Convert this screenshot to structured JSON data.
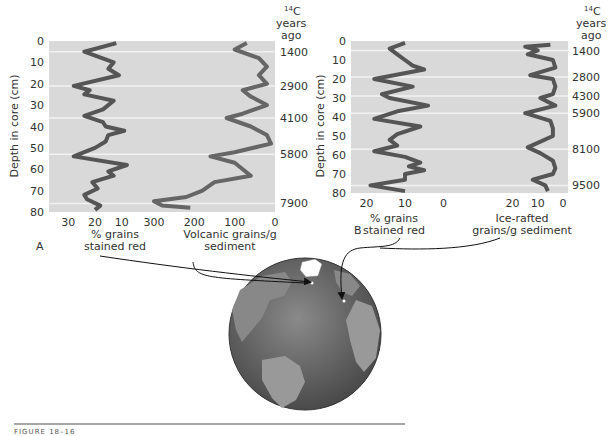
{
  "figure": {
    "caption": "FIGURE 18–16",
    "globe_alt": "North Atlantic globe with core locations"
  },
  "chart_data": [
    {
      "panel": "A",
      "type": "line",
      "orientation": "vertical-profile",
      "ylabel": "Depth in core (cm)",
      "ylim": [
        0,
        80
      ],
      "yticks": [
        0,
        10,
        20,
        30,
        40,
        50,
        60,
        70,
        80
      ],
      "right_axis_title": "14C years ago",
      "age_markers": [
        {
          "depth": 5,
          "age": "1400"
        },
        {
          "depth": 21,
          "age": "2900"
        },
        {
          "depth": 36,
          "age": "4100"
        },
        {
          "depth": 53,
          "age": "5800"
        },
        {
          "depth": 76,
          "age": "7900"
        }
      ],
      "series": [
        {
          "name": "% grains stained red",
          "xlabel": "% grains stained red",
          "xticks": [
            30,
            20,
            10
          ],
          "xlim": [
            35,
            5
          ],
          "depth": [
            1,
            5,
            10,
            13,
            16,
            21,
            23,
            25,
            28,
            32,
            35,
            38,
            40,
            42,
            44,
            47,
            50,
            54,
            58,
            61,
            63,
            66,
            69,
            72,
            74,
            77,
            79
          ],
          "values": [
            12,
            24,
            13,
            15,
            11,
            28,
            22,
            24,
            13,
            17,
            24,
            17,
            16,
            9,
            15,
            16,
            20,
            28,
            8,
            15,
            13,
            21,
            19,
            24,
            23,
            18,
            20
          ]
        },
        {
          "name": "Volcanic grains/g sediment",
          "xlabel": "Volcanic grains/g sediment",
          "xticks": [
            300,
            200,
            100,
            0
          ],
          "xlim": [
            310,
            0
          ],
          "depth": [
            1,
            4,
            8,
            12,
            16,
            20,
            23,
            26,
            30,
            34,
            36,
            40,
            44,
            48,
            52,
            54,
            57,
            60,
            63,
            66,
            70,
            73,
            75,
            77,
            78
          ],
          "values": [
            70,
            100,
            40,
            20,
            40,
            20,
            80,
            60,
            20,
            80,
            120,
            60,
            20,
            10,
            100,
            160,
            100,
            80,
            60,
            150,
            180,
            220,
            300,
            280,
            210
          ]
        }
      ]
    },
    {
      "panel": "B",
      "type": "line",
      "orientation": "vertical-profile",
      "ylabel": "Depth in core (cm)",
      "ylim": [
        0,
        80
      ],
      "yticks": [
        0,
        10,
        20,
        30,
        40,
        50,
        60,
        70,
        80
      ],
      "right_axis_title": "14C years ago",
      "age_markers": [
        {
          "depth": 5,
          "age": "1400"
        },
        {
          "depth": 19,
          "age": "2800"
        },
        {
          "depth": 29,
          "age": "4300"
        },
        {
          "depth": 38,
          "age": "5900"
        },
        {
          "depth": 57,
          "age": "8100"
        },
        {
          "depth": 76,
          "age": "9500"
        }
      ],
      "series": [
        {
          "name": "% grains stained red",
          "xlabel": "% grains stained red",
          "xticks": [
            20,
            10,
            0
          ],
          "xlim": [
            23,
            -3
          ],
          "depth": [
            1,
            4,
            7,
            10,
            13,
            15,
            20,
            24,
            28,
            30,
            34,
            37,
            41,
            45,
            49,
            52,
            55,
            58,
            61,
            64,
            66,
            68,
            70,
            73,
            76,
            79
          ],
          "values": [
            10,
            14,
            12,
            10,
            8,
            5,
            18,
            8,
            16,
            14,
            4,
            12,
            18,
            6,
            12,
            14,
            12,
            18,
            10,
            6,
            9,
            5,
            10,
            10,
            19,
            10
          ]
        },
        {
          "name": "Ice-rafted grains/g sediment",
          "xlabel": "Ice-rafted grains/g sediment",
          "xticks": [
            20,
            10,
            0
          ],
          "xlim": [
            25,
            -2
          ],
          "depth": [
            2,
            3,
            5,
            7,
            10,
            14,
            18,
            20,
            24,
            28,
            30,
            34,
            38,
            42,
            46,
            50,
            56,
            59,
            63,
            67,
            70,
            73,
            76,
            79
          ],
          "values": [
            5,
            15,
            10,
            14,
            4,
            3,
            13,
            4,
            3,
            4,
            9,
            3,
            15,
            5,
            4,
            4,
            14,
            9,
            4,
            3,
            4,
            12,
            7,
            6
          ]
        }
      ]
    }
  ],
  "labels": {
    "a_panel_letter": "A",
    "b_panel_letter": "B",
    "a_left_xlabel_line1": "% grains",
    "a_left_xlabel_line2": "stained red",
    "a_right_xlabel_line1": "Volcanic grains/g",
    "a_right_xlabel_line2": "sediment",
    "b_left_xlabel_line1": "% grains",
    "b_left_xlabel_line2": "stained red",
    "b_right_xlabel_line1": "Ice-rafted",
    "b_right_xlabel_line2": "grains/g sediment",
    "ylabel": "Depth in core (cm)",
    "c14_sup": "14",
    "c14_c": "C",
    "years": "years",
    "ago": "ago"
  }
}
